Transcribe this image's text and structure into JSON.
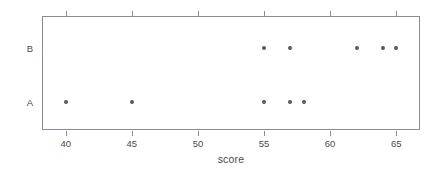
{
  "chart_data": {
    "type": "scatter",
    "title": "",
    "xlabel": "score",
    "ylabel": "Treatment",
    "xlim": [
      38.2,
      66.8
    ],
    "xticks": [
      40,
      45,
      50,
      55,
      60,
      65
    ],
    "xticklabels": [
      "40",
      "45",
      "50",
      "55",
      "60",
      "65"
    ],
    "ycategories": [
      "A",
      "B"
    ],
    "yticklabels": [
      "A",
      "B"
    ],
    "grid": false,
    "legend": false,
    "point_color": "#595959",
    "axis_color": "#8c8c8c",
    "text_color": "#4a4a4a",
    "series": [
      {
        "name": "A",
        "category": "A",
        "x": [
          40,
          45,
          55,
          57,
          58
        ],
        "values": [
          40,
          45,
          55,
          57,
          58
        ]
      },
      {
        "name": "B",
        "category": "B",
        "x": [
          55,
          57,
          62,
          64,
          65
        ],
        "values": [
          55,
          57,
          62,
          64,
          65
        ]
      }
    ]
  }
}
